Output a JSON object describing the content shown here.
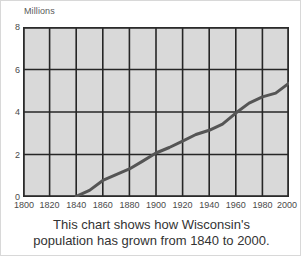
{
  "chart_data": {
    "type": "line",
    "title": "",
    "subtitle": "",
    "xlabel": "",
    "ylabel": "Millions",
    "y_unit_label": "Millions",
    "xlim": [
      1800,
      2000
    ],
    "ylim": [
      0,
      8
    ],
    "grid": true,
    "legend": false,
    "legend_position": "none",
    "x_ticks": [
      1800,
      1820,
      1840,
      1860,
      1880,
      1900,
      1920,
      1940,
      1960,
      1980,
      2000
    ],
    "x_tick_labels": [
      "1800",
      "1820",
      "1840",
      "1860",
      "1880",
      "1900",
      "1920",
      "1940",
      "1960",
      "1980",
      "2000"
    ],
    "y_ticks": [
      0,
      2,
      4,
      6,
      8
    ],
    "y_tick_labels": [
      "0",
      "2",
      "4",
      "6",
      "8"
    ],
    "y_gridlines": [
      2,
      4,
      6
    ],
    "x_gridlines": [
      1820,
      1840,
      1860,
      1880,
      1900,
      1920,
      1940,
      1960,
      1980
    ],
    "series": [
      {
        "name": "Wisconsin population",
        "x": [
          1840,
          1850,
          1860,
          1870,
          1880,
          1890,
          1900,
          1910,
          1920,
          1930,
          1940,
          1950,
          1960,
          1970,
          1980,
          1990,
          2000
        ],
        "values": [
          0.03,
          0.31,
          0.78,
          1.05,
          1.32,
          1.69,
          2.07,
          2.33,
          2.63,
          2.94,
          3.14,
          3.43,
          3.95,
          4.42,
          4.71,
          4.89,
          5.36
        ],
        "color": "#555555",
        "line_width": 3
      }
    ],
    "plot_background": "#d9d9d9",
    "grid_color": "#262626",
    "axis_color": "#2b2b2b"
  },
  "caption": {
    "line1": "This chart shows how Wisconsin's",
    "line2": "population has grown from 1840 to 2000."
  },
  "colors": {
    "plot_fill": "#d9d9d9",
    "grid": "#262626",
    "line": "#555555",
    "tick_text": "#4a4a4a",
    "caption_text": "#333333",
    "figure_border": "#d8d8d8"
  }
}
